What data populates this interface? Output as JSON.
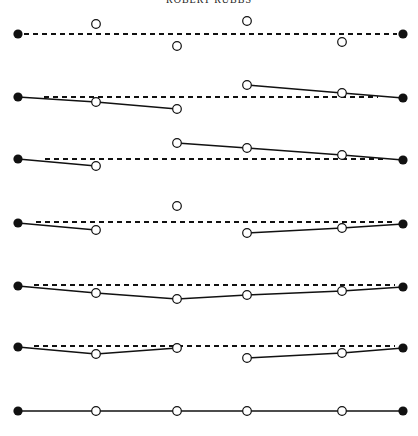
{
  "caption": "ROBERT RUBBS",
  "colors": {
    "ink": "#111111",
    "background": "#ffffff"
  },
  "x_positions": [
    18,
    96,
    177,
    247,
    342,
    403
  ],
  "rows": [
    {
      "id": "row-1",
      "reference": {
        "y1": 34,
        "y2": 34,
        "x1": 24,
        "x2": 397,
        "style": "dashed"
      },
      "endpoints": [
        {
          "x": 18,
          "y": 34
        },
        {
          "x": 403,
          "y": 34
        }
      ],
      "points": [
        {
          "x": 96,
          "y": 24
        },
        {
          "x": 177,
          "y": 46
        },
        {
          "x": 247,
          "y": 21
        },
        {
          "x": 342,
          "y": 42
        }
      ],
      "segments": []
    },
    {
      "id": "row-2",
      "reference": {
        "y1": 97,
        "y2": 97,
        "x1": 44,
        "x2": 378,
        "style": "dashed"
      },
      "endpoints": [
        {
          "x": 18,
          "y": 97
        },
        {
          "x": 403,
          "y": 98
        }
      ],
      "points": [
        {
          "x": 96,
          "y": 102
        },
        {
          "x": 177,
          "y": 109
        },
        {
          "x": 247,
          "y": 85
        },
        {
          "x": 342,
          "y": 93
        }
      ],
      "segments": [
        [
          {
            "x": 18,
            "y": 97
          },
          {
            "x": 96,
            "y": 102
          },
          {
            "x": 177,
            "y": 109
          }
        ],
        [
          {
            "x": 247,
            "y": 85
          },
          {
            "x": 342,
            "y": 93
          },
          {
            "x": 403,
            "y": 98
          }
        ]
      ]
    },
    {
      "id": "row-3",
      "reference": {
        "y1": 159,
        "y2": 159,
        "x1": 45,
        "x2": 385,
        "style": "dashed"
      },
      "endpoints": [
        {
          "x": 18,
          "y": 159
        },
        {
          "x": 403,
          "y": 160
        }
      ],
      "points": [
        {
          "x": 96,
          "y": 166
        },
        {
          "x": 177,
          "y": 143
        },
        {
          "x": 247,
          "y": 148
        },
        {
          "x": 342,
          "y": 155
        }
      ],
      "segments": [
        [
          {
            "x": 18,
            "y": 159
          },
          {
            "x": 96,
            "y": 166
          }
        ],
        [
          {
            "x": 177,
            "y": 143
          },
          {
            "x": 247,
            "y": 148
          },
          {
            "x": 342,
            "y": 155
          },
          {
            "x": 403,
            "y": 160
          }
        ]
      ]
    },
    {
      "id": "row-4",
      "reference": {
        "y1": 222,
        "y2": 222,
        "x1": 36,
        "x2": 395,
        "style": "dashed"
      },
      "endpoints": [
        {
          "x": 18,
          "y": 223
        },
        {
          "x": 403,
          "y": 224
        }
      ],
      "points": [
        {
          "x": 96,
          "y": 230
        },
        {
          "x": 177,
          "y": 206
        },
        {
          "x": 247,
          "y": 233
        },
        {
          "x": 342,
          "y": 228
        }
      ],
      "segments": [
        [
          {
            "x": 18,
            "y": 223
          },
          {
            "x": 96,
            "y": 230
          }
        ],
        [
          {
            "x": 247,
            "y": 233
          },
          {
            "x": 342,
            "y": 228
          },
          {
            "x": 403,
            "y": 224
          }
        ]
      ]
    },
    {
      "id": "row-5",
      "reference": {
        "y1": 285,
        "y2": 285,
        "x1": 34,
        "x2": 395,
        "style": "dashed"
      },
      "endpoints": [
        {
          "x": 18,
          "y": 286
        },
        {
          "x": 403,
          "y": 287
        }
      ],
      "points": [
        {
          "x": 96,
          "y": 293
        },
        {
          "x": 177,
          "y": 299
        },
        {
          "x": 247,
          "y": 295
        },
        {
          "x": 342,
          "y": 291
        }
      ],
      "segments": [
        [
          {
            "x": 18,
            "y": 286
          },
          {
            "x": 96,
            "y": 293
          },
          {
            "x": 177,
            "y": 299
          },
          {
            "x": 247,
            "y": 295
          },
          {
            "x": 342,
            "y": 291
          },
          {
            "x": 403,
            "y": 287
          }
        ]
      ]
    },
    {
      "id": "row-6",
      "reference": {
        "y1": 346,
        "y2": 346,
        "x1": 34,
        "x2": 395,
        "style": "dashed"
      },
      "endpoints": [
        {
          "x": 18,
          "y": 347
        },
        {
          "x": 403,
          "y": 348
        }
      ],
      "points": [
        {
          "x": 96,
          "y": 354
        },
        {
          "x": 177,
          "y": 348
        },
        {
          "x": 247,
          "y": 358
        },
        {
          "x": 342,
          "y": 353
        }
      ],
      "segments": [
        [
          {
            "x": 18,
            "y": 347
          },
          {
            "x": 96,
            "y": 354
          },
          {
            "x": 177,
            "y": 348
          }
        ],
        [
          {
            "x": 247,
            "y": 358
          },
          {
            "x": 342,
            "y": 353
          },
          {
            "x": 403,
            "y": 348
          }
        ]
      ]
    },
    {
      "id": "row-7",
      "reference": null,
      "endpoints": [
        {
          "x": 18,
          "y": 411
        },
        {
          "x": 403,
          "y": 411
        }
      ],
      "points": [
        {
          "x": 96,
          "y": 411
        },
        {
          "x": 177,
          "y": 411
        },
        {
          "x": 247,
          "y": 411
        },
        {
          "x": 342,
          "y": 411
        }
      ],
      "segments": [
        [
          {
            "x": 18,
            "y": 411
          },
          {
            "x": 96,
            "y": 411
          },
          {
            "x": 177,
            "y": 411
          },
          {
            "x": 247,
            "y": 411
          },
          {
            "x": 342,
            "y": 411
          },
          {
            "x": 403,
            "y": 411
          }
        ]
      ]
    }
  ]
}
